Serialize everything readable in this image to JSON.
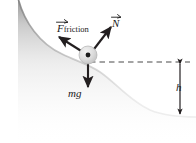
{
  "figure": {
    "background_color": "#ffffff",
    "ink_color": "#231f20",
    "surface_fill_color": "#b8b8b8"
  },
  "labels": {
    "friction": {
      "symbol": "F",
      "subscript": "friction",
      "has_vector_arrow": true,
      "text": "F friction"
    },
    "normal": {
      "symbol": "N",
      "has_vector_arrow": true,
      "text": "N"
    },
    "weight": {
      "text": "mg"
    },
    "height": {
      "text": "h"
    }
  },
  "vectors": [
    {
      "name": "friction-force",
      "label": "F friction",
      "direction": "up-left",
      "origin": [
        88,
        56
      ]
    },
    {
      "name": "normal-force",
      "label": "N",
      "direction": "up-right",
      "origin": [
        88,
        56
      ]
    },
    {
      "name": "weight-force",
      "label": "mg",
      "direction": "down",
      "origin": [
        88,
        56
      ]
    }
  ],
  "annotations": {
    "reference_line": "dashed horizontal line from particle to right edge",
    "height_measure": "double-headed vertical arrow labelled h"
  },
  "particle": {
    "center": [
      88,
      56
    ],
    "radius": 9,
    "dot_radius": 2.4
  }
}
